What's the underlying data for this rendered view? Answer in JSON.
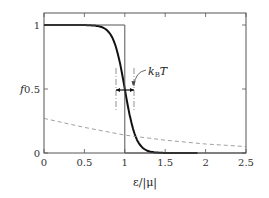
{
  "chart_data": {
    "type": "line",
    "title": "",
    "xlabel": "ε/|μ|",
    "ylabel": "f",
    "xlim": [
      0,
      2.5
    ],
    "ylim": [
      0,
      1.05
    ],
    "grid": false,
    "x_ticks": [
      "0",
      "0.5",
      "1",
      "1.5",
      "2",
      "2.5"
    ],
    "y_ticks": [
      "0",
      "0.5",
      "1"
    ],
    "annotation": "k_B T",
    "annotation_text": "k",
    "annotation_sub": "B",
    "annotation_tail": "T",
    "series": [
      {
        "name": "Fermi-Dirac distribution (T>0)",
        "style": "solid-thick",
        "x": [
          0,
          0.5,
          0.7,
          0.8,
          0.9,
          0.95,
          1.0,
          1.05,
          1.1,
          1.2,
          1.3,
          1.5,
          1.7,
          1.9
        ],
        "values": [
          1.0,
          0.99,
          0.97,
          0.92,
          0.78,
          0.65,
          0.5,
          0.35,
          0.22,
          0.08,
          0.03,
          0.005,
          0.001,
          0.0
        ]
      },
      {
        "name": "T=0 step function",
        "style": "solid-thin",
        "x": [
          0,
          1,
          1,
          2.5
        ],
        "values": [
          1,
          1,
          0,
          0
        ]
      },
      {
        "name": "Boltzmann-like tail",
        "style": "dashed",
        "x": [
          0,
          0.5,
          1.0,
          1.5,
          2.0,
          2.5
        ],
        "values": [
          0.27,
          0.2,
          0.14,
          0.1,
          0.07,
          0.05
        ]
      }
    ]
  }
}
